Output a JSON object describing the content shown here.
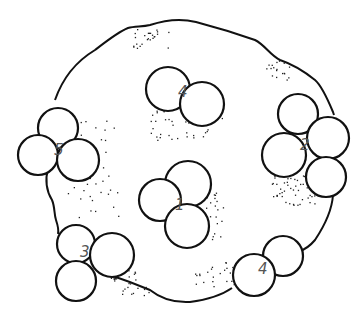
{
  "diagram": {
    "outline_color": "#111111",
    "label_color": "#555555",
    "clusters": [
      {
        "id": "top-4",
        "label": "4",
        "label_pos": [
          178,
          97
        ],
        "circles": [
          [
            168,
            89,
            22
          ],
          [
            202,
            104,
            22
          ]
        ]
      },
      {
        "id": "left-5",
        "label": "5",
        "label_pos": [
          54,
          155
        ],
        "circles": [
          [
            58,
            128,
            20
          ],
          [
            38,
            155,
            20
          ],
          [
            78,
            160,
            21
          ]
        ]
      },
      {
        "id": "right-2",
        "label": "2",
        "label_pos": [
          300,
          150
        ],
        "circles": [
          [
            298,
            114,
            20
          ],
          [
            328,
            138,
            21
          ],
          [
            284,
            155,
            22
          ],
          [
            326,
            177,
            20
          ]
        ]
      },
      {
        "id": "center-1",
        "label": "1",
        "label_pos": [
          175,
          210
        ],
        "circles": [
          [
            188,
            184,
            23
          ],
          [
            160,
            200,
            21
          ],
          [
            187,
            226,
            22
          ]
        ]
      },
      {
        "id": "bottom-left-3",
        "label": "3",
        "label_pos": [
          80,
          257
        ],
        "circles": [
          [
            76,
            244,
            19
          ],
          [
            112,
            255,
            22
          ],
          [
            76,
            281,
            20
          ]
        ]
      },
      {
        "id": "bottom-right-4",
        "label": "4",
        "label_pos": [
          258,
          274
        ],
        "circles": [
          [
            283,
            256,
            20
          ],
          [
            254,
            275,
            21
          ]
        ]
      }
    ]
  }
}
